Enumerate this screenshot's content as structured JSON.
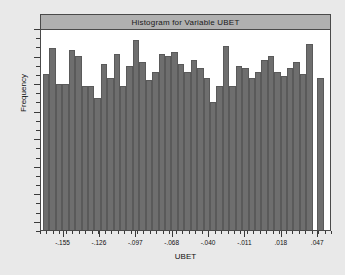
{
  "chart_data": {
    "type": "bar",
    "title": "Histogram for Variable UBET",
    "xlabel": "UBET",
    "ylabel": "Frequency",
    "grid": false,
    "legend": null,
    "xtick_labels": [
      "-.155",
      "-.126",
      "-.097",
      "-.068",
      "-.040",
      "-.011",
      ".018",
      ".047"
    ],
    "xtick_values": [
      -0.155,
      -0.126,
      -0.097,
      -0.068,
      -0.04,
      -0.011,
      0.018,
      0.047
    ],
    "ytick_labels": [],
    "xlim": [
      -0.165,
      0.058
    ],
    "ylim": [
      0,
      100
    ],
    "categories": [
      "-.160",
      "-.155",
      "-.150",
      "-.145",
      "-.140",
      "-.136",
      "-.131",
      "-.126",
      "-.121",
      "-.116",
      "-.111",
      "-.107",
      "-.102",
      "-.097",
      "-.092",
      "-.087",
      "-.082",
      "-.078",
      "-.073",
      "-.068",
      "-.063",
      "-.058",
      "-.053",
      "-.049",
      "-.044",
      "-.040",
      "-.035",
      "-.030",
      "-.025",
      "-.020",
      "-.016",
      "-.011",
      "-.006",
      "-.001",
      ".004",
      ".009",
      ".013",
      ".018",
      ".023",
      ".028",
      ".033",
      ".038",
      ".042",
      ".047",
      ".052"
    ],
    "values": [
      78,
      91,
      73,
      73,
      90,
      87,
      72,
      72,
      66,
      83,
      76,
      88,
      72,
      82,
      95,
      84,
      75,
      79,
      88,
      87,
      89,
      83,
      79,
      85,
      81,
      76,
      64,
      72,
      92,
      72,
      82,
      81,
      76,
      79,
      85,
      87,
      79,
      77,
      81,
      84,
      78,
      93,
      0,
      76,
      0
    ]
  },
  "chart": {
    "bar_color": "#6e6e6e",
    "bar_edge_color": "#5a5a5a",
    "frame_color": "#4a4a4a",
    "title_banner_color": "#b0b0b0",
    "plot_background": "#ffffff",
    "page_background": "#e9e9e9",
    "text_color": "#111111"
  }
}
